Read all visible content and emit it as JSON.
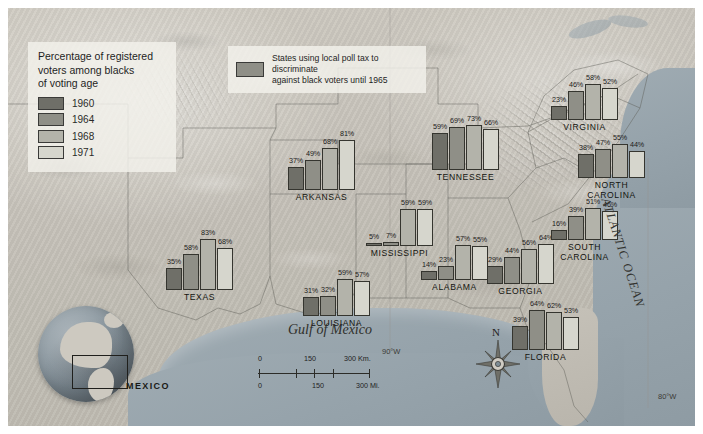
{
  "legend": {
    "title": "Percentage of registered voters among blacks of voting age",
    "title_line1": "Percentage of registered",
    "title_line2": "voters among blacks",
    "title_line3": "of voting age",
    "entries": [
      {
        "year": "1960",
        "color": "#6f6f68"
      },
      {
        "year": "1964",
        "color": "#8f8f87"
      },
      {
        "year": "1968",
        "color": "#b3b3aa"
      },
      {
        "year": "1971",
        "color": "#d6d6cd"
      }
    ]
  },
  "polltax_legend": {
    "swatch_color": "#8f8f87",
    "line1": "States using local poll tax to discriminate",
    "line2": "against black voters until 1965"
  },
  "chart_data": {
    "type": "bar",
    "title": "Percentage of registered voters among blacks of voting age",
    "ylabel": "Percent registered",
    "ylim": [
      0,
      100
    ],
    "grid": false,
    "legend_position": "top-left",
    "series": [
      {
        "name": "1960",
        "color": "#6f6f68"
      },
      {
        "name": "1964",
        "color": "#8f8f87"
      },
      {
        "name": "1968",
        "color": "#b3b3aa"
      },
      {
        "name": "1971",
        "color": "#d6d6cd"
      }
    ],
    "categories": [
      "TEXAS",
      "ARKANSAS",
      "LOUISIANA",
      "MISSISSIPPI",
      "ALABAMA",
      "TENNESSEE",
      "GEORGIA",
      "FLORIDA",
      "SOUTH CAROLINA",
      "NORTH CAROLINA",
      "VIRGINIA"
    ],
    "values": {
      "TEXAS": [
        35,
        58,
        83,
        68
      ],
      "ARKANSAS": [
        37,
        49,
        68,
        81
      ],
      "LOUISIANA": [
        31,
        32,
        59,
        57
      ],
      "MISSISSIPPI": [
        5,
        7,
        59,
        59
      ],
      "ALABAMA": [
        14,
        23,
        57,
        55
      ],
      "TENNESSEE": [
        59,
        69,
        73,
        66
      ],
      "GEORGIA": [
        29,
        44,
        56,
        64
      ],
      "FLORIDA": [
        39,
        64,
        62,
        53
      ],
      "SOUTH CAROLINA": [
        16,
        39,
        51,
        46
      ],
      "NORTH CAROLINA": [
        38,
        47,
        55,
        44
      ],
      "VIRGINIA": [
        23,
        46,
        58,
        52
      ]
    }
  },
  "clusters": [
    {
      "id": "texas",
      "name": "TEXAS",
      "x": 166,
      "y": 228,
      "values": [
        "35%",
        "58%",
        "83%",
        "68%"
      ],
      "nums": [
        35,
        58,
        83,
        68
      ]
    },
    {
      "id": "arkansas",
      "name": "ARKANSAS",
      "x": 288,
      "y": 128,
      "values": [
        "37%",
        "49%",
        "68%",
        "81%"
      ],
      "nums": [
        37,
        49,
        68,
        81
      ]
    },
    {
      "id": "louisiana",
      "name": "LOUISIANA",
      "x": 303,
      "y": 254,
      "values": [
        "31%",
        "32%",
        "59%",
        "57%"
      ],
      "nums": [
        31,
        32,
        59,
        57
      ]
    },
    {
      "id": "mississippi",
      "name": "MISSISSIPPI",
      "x": 366,
      "y": 184,
      "values": [
        "5%",
        "7%",
        "59%",
        "59%"
      ],
      "nums": [
        5,
        7,
        59,
        59
      ]
    },
    {
      "id": "alabama",
      "name": "ALABAMA",
      "x": 421,
      "y": 218,
      "values": [
        "14%",
        "23%",
        "57%",
        "55%"
      ],
      "nums": [
        14,
        23,
        57,
        55
      ]
    },
    {
      "id": "tennessee",
      "name": "TENNESSEE",
      "x": 432,
      "y": 108,
      "values": [
        "59%",
        "69%",
        "73%",
        "66%"
      ],
      "nums": [
        59,
        69,
        73,
        66
      ]
    },
    {
      "id": "georgia",
      "name": "GEORGIA",
      "x": 487,
      "y": 222,
      "values": [
        "29%",
        "44%",
        "56%",
        "64%"
      ],
      "nums": [
        29,
        44,
        56,
        64
      ]
    },
    {
      "id": "florida",
      "name": "FLORIDA",
      "x": 512,
      "y": 288,
      "values": [
        "39%",
        "64%",
        "62%",
        "53%"
      ],
      "nums": [
        39,
        64,
        62,
        53
      ]
    },
    {
      "id": "south-carolina",
      "name": "SOUTH\nCAROLINA",
      "x": 551,
      "y": 178,
      "values": [
        "16%",
        "39%",
        "51%",
        "46%"
      ],
      "nums": [
        16,
        39,
        51,
        46
      ]
    },
    {
      "id": "north-carolina",
      "name": "NORTH\nCAROLINA",
      "x": 578,
      "y": 116,
      "values": [
        "38%",
        "47%",
        "55%",
        "44%"
      ],
      "nums": [
        38,
        47,
        55,
        44
      ]
    },
    {
      "id": "virginia",
      "name": "VIRGINIA",
      "x": 551,
      "y": 58,
      "values": [
        "23%",
        "46%",
        "58%",
        "52%"
      ],
      "nums": [
        23,
        46,
        58,
        52
      ]
    }
  ],
  "map_labels": {
    "gulf": "Gulf of Mexico",
    "atlantic": "ATLANTIC OCEAN",
    "mexico": "MEXICO",
    "lon_90w": "90°W",
    "lon_80w": "80°W",
    "compass_north": "N"
  },
  "scalebar": {
    "km": {
      "ticks": [
        "0",
        "150",
        "300 Km."
      ],
      "unit": "Km."
    },
    "mi": {
      "ticks": [
        "0",
        "150",
        "300 Mi."
      ],
      "unit": "Mi."
    }
  }
}
